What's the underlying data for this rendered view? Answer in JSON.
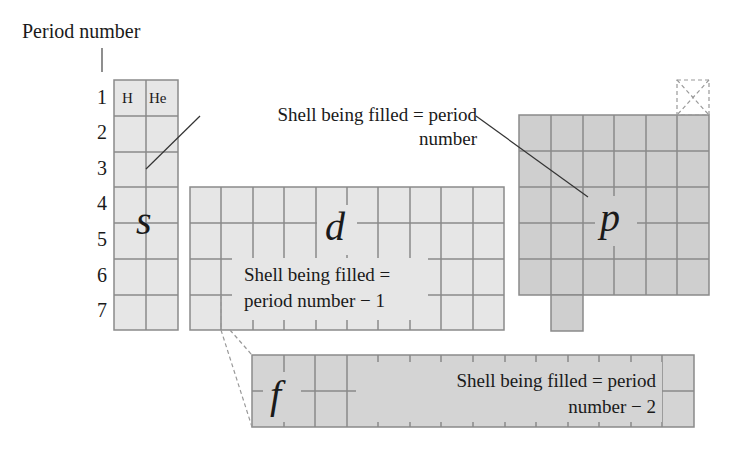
{
  "title": "Period number",
  "period_numbers": [
    "1",
    "2",
    "3",
    "4",
    "5",
    "6",
    "7"
  ],
  "elements": {
    "h": "H",
    "he": "He"
  },
  "blocks": {
    "s": {
      "letter": "s",
      "fill": "#e6e6e6"
    },
    "d": {
      "letter": "d",
      "fill": "#e6e6e6"
    },
    "p": {
      "letter": "p",
      "fill": "#cfcfcf"
    },
    "f": {
      "letter": "f",
      "fill": "#d4d4d4"
    }
  },
  "annotations": {
    "sp": {
      "line1": "Shell being filled = period",
      "line2": "number"
    },
    "d": {
      "line1": "Shell being filled =",
      "line2": "period number − 1"
    },
    "f": {
      "line1": "Shell being filled = period",
      "line2": "number − 2"
    }
  },
  "colors": {
    "grid": "#8a8a8a",
    "text": "#1a1a1a"
  }
}
